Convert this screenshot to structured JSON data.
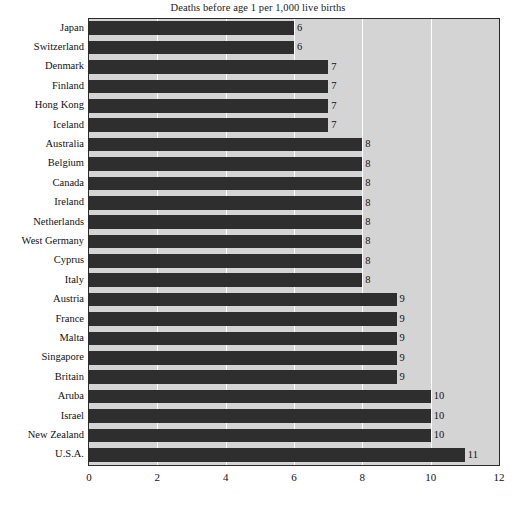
{
  "chart_data": {
    "type": "bar",
    "orientation": "horizontal",
    "title": "Deaths before age 1 per 1,000 live births",
    "xlabel": "",
    "ylabel": "",
    "xlim": [
      0,
      12
    ],
    "xticks": [
      0,
      2,
      4,
      6,
      8,
      10,
      12
    ],
    "xticklabels": [
      "0",
      "2",
      "4",
      "6",
      "8",
      "10",
      "12"
    ],
    "grid": "vertical",
    "legend": "none",
    "bar_color": "#2e2e2e",
    "plot_background": "#d4d4d4",
    "categories": [
      "Japan",
      "Switzerland",
      "Denmark",
      "Finland",
      "Hong Kong",
      "Iceland",
      "Australia",
      "Belgium",
      "Canada",
      "Ireland",
      "Netherlands",
      "West Germany",
      "Cyprus",
      "Italy",
      "Austria",
      "France",
      "Malta",
      "Singapore",
      "Britain",
      "Aruba",
      "Israel",
      "New Zealand",
      "U.S.A."
    ],
    "values": [
      6,
      6,
      7,
      7,
      7,
      7,
      8,
      8,
      8,
      8,
      8,
      8,
      8,
      8,
      9,
      9,
      9,
      9,
      9,
      10,
      10,
      10,
      11
    ],
    "value_labels": [
      "6",
      "6",
      "7",
      "7",
      "7",
      "7",
      "8",
      "8",
      "8",
      "8",
      "8",
      "8",
      "8",
      "8",
      "9",
      "9",
      "9",
      "9",
      "9",
      "10",
      "10",
      "10",
      "11"
    ]
  }
}
